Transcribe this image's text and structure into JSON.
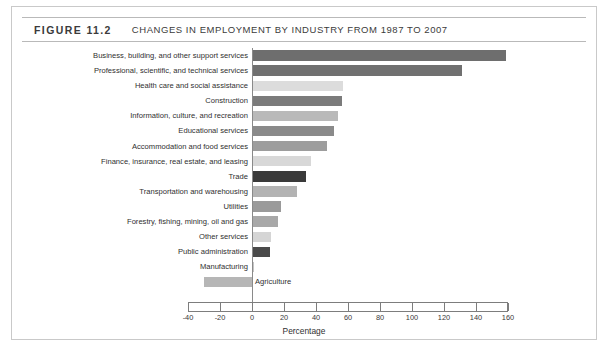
{
  "figure": {
    "number_label": "FIGURE 11.2",
    "title": "CHANGES IN EMPLOYMENT BY INDUSTRY FROM 1987 TO 2007"
  },
  "chart_data": {
    "type": "bar",
    "orientation": "horizontal",
    "title": "CHANGES IN EMPLOYMENT BY INDUSTRY FROM 1987 TO 2007",
    "xlabel": "Percentage",
    "ylabel": "",
    "xlim": [
      -40,
      160
    ],
    "xticks": [
      -40,
      -20,
      0,
      20,
      40,
      60,
      80,
      100,
      120,
      140,
      160
    ],
    "xtick_labels": [
      "-40",
      "-20",
      "0",
      "20",
      "40",
      "60",
      "80",
      "100",
      "120",
      "140",
      "160"
    ],
    "grid": false,
    "legend": "none",
    "categories": [
      "Business, building, and other support services",
      "Professional, scientific, and technical services",
      "Health care and social assistance",
      "Construction",
      "Information, culture, and recreation",
      "Educational services",
      "Accommodation and food services",
      "Finance, insurance, real estate, and leasing",
      "Trade",
      "Transportation and warehousing",
      "Utilities",
      "Forestry, fishing, mining, oil and gas",
      "Other services",
      "Public administration",
      "Manufacturing",
      "Agriculture"
    ],
    "values": [
      159,
      131,
      57,
      56,
      54,
      51,
      47,
      37,
      34,
      28,
      18,
      16,
      12,
      11,
      1,
      -30
    ],
    "bar_colors": [
      "#6e6e6e",
      "#707070",
      "#dcdcdc",
      "#7b7b7b",
      "#b9b9b9",
      "#8a8a8a",
      "#9d9d9d",
      "#d8d8d8",
      "#3a3a3a",
      "#b3b3b3",
      "#9a9a9a",
      "#a8a8a8",
      "#d5d5d5",
      "#4a4a4a",
      "#c4c4c4",
      "#b6b6b6"
    ]
  }
}
